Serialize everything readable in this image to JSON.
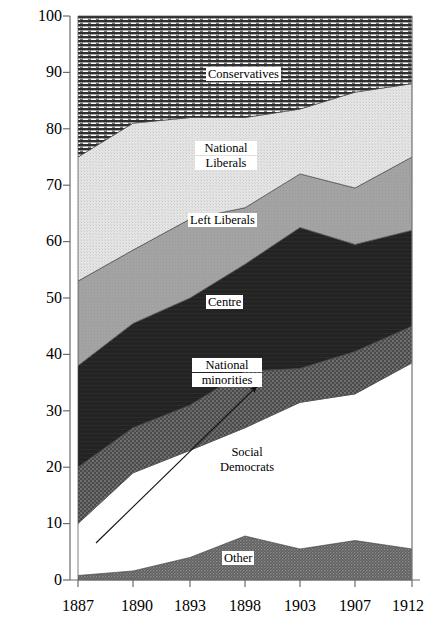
{
  "chart_data": {
    "type": "area",
    "title": "",
    "xlabel": "",
    "ylabel": "Percentage of total votes cast (first ballot)",
    "x": [
      1887,
      1890,
      1893,
      1898,
      1903,
      1907,
      1912
    ],
    "xtick_labels": [
      "1887",
      "1890",
      "1893",
      "1898",
      "1903",
      "1907",
      "1912"
    ],
    "ytick_labels": [
      "0",
      "10",
      "20",
      "30",
      "40",
      "50",
      "60",
      "70",
      "80",
      "90",
      "100"
    ],
    "ylim": [
      0,
      100
    ],
    "ytick_step": 10,
    "grid": false,
    "legend": "inline-band-labels",
    "stacked": true,
    "stack_order_bottom_to_top": [
      "Other",
      "Social Democrats",
      "National minorities",
      "Centre",
      "Left Liberals",
      "National Liberals",
      "Conservatives"
    ],
    "series": [
      {
        "name": "Other",
        "fill": "#6b6b6b",
        "pattern": "fine-dots",
        "values": [
          0.8,
          1.6,
          4.0,
          7.8,
          5.5,
          7.0,
          5.5
        ]
      },
      {
        "name": "Social Democrats",
        "fill": "#ffffff",
        "pattern": "solid-white",
        "values": [
          9.2,
          17.4,
          19.0,
          19.2,
          26.0,
          26.0,
          33.0
        ]
      },
      {
        "name": "National minorities",
        "fill": "#555555",
        "pattern": "coarse-dots",
        "values": [
          10.0,
          8.0,
          8.0,
          10.0,
          6.0,
          7.5,
          6.5
        ]
      },
      {
        "name": "Centre",
        "fill": "#262626",
        "pattern": "solid-dark",
        "values": [
          18.0,
          18.5,
          19.0,
          19.0,
          20.0,
          19.0,
          17.0
        ]
      },
      {
        "name": "Left Liberals",
        "fill": "#9c9c9c",
        "pattern": "solid-mid-gray",
        "values": [
          15.0,
          13.0,
          14.0,
          10.0,
          9.5,
          10.0,
          13.0
        ]
      },
      {
        "name": "National Liberals",
        "fill": "#dedede",
        "pattern": "light-stipple",
        "values": [
          22.0,
          22.5,
          18.0,
          16.0,
          16.5,
          17.0,
          13.0
        ]
      },
      {
        "name": "Conservatives",
        "fill": "#3a3a3a",
        "pattern": "horizontal-lines",
        "values": [
          25.0,
          19.0,
          18.0,
          18.0,
          16.5,
          13.5,
          12.0
        ]
      }
    ],
    "cumulative_tops": {
      "Other": [
        0.8,
        1.6,
        4.0,
        7.8,
        5.5,
        7.0,
        5.5
      ],
      "Social Democrats": [
        10.0,
        19.0,
        23.0,
        27.0,
        31.5,
        33.0,
        38.5
      ],
      "National minorities": [
        20.0,
        27.0,
        31.0,
        37.0,
        37.5,
        40.5,
        45.0
      ],
      "Centre": [
        38.0,
        45.5,
        50.0,
        56.0,
        62.5,
        59.5,
        62.0
      ],
      "Left Liberals": [
        53.0,
        58.5,
        64.0,
        66.0,
        72.0,
        69.5,
        75.0
      ],
      "National Liberals": [
        75.0,
        81.0,
        82.0,
        82.0,
        83.5,
        86.5,
        88.0
      ],
      "Conservatives": [
        100,
        100,
        100,
        100,
        100,
        100,
        100
      ]
    },
    "annotations": [
      {
        "name": "social-democrats-arrow",
        "type": "arrow",
        "from": [
          1888.2,
          6.5
        ],
        "to": [
          1899.0,
          34.0
        ]
      }
    ]
  },
  "labels": {
    "conservatives": "Conservatives",
    "national_liberals_line1": "National",
    "national_liberals_line2": "Liberals",
    "left_liberals": "Left Liberals",
    "centre": "Centre",
    "national_minorities_line1": "National",
    "national_minorities_line2": "minorities",
    "social_democrats_line1": "Social",
    "social_democrats_line2": "Democrats",
    "other": "Other"
  },
  "axis": {
    "y_title": "Percentage of total votes cast (first ballot)",
    "y_ticks": [
      "100",
      "90",
      "80",
      "70",
      "60",
      "50",
      "40",
      "30",
      "20",
      "10",
      "0"
    ],
    "x_ticks": [
      "1887",
      "1890",
      "1893",
      "1898",
      "1903",
      "1907",
      "1912"
    ]
  },
  "colors": {
    "conservatives": "#3a3a3a",
    "national_liberals": "#dedede",
    "left_liberals": "#9c9c9c",
    "centre": "#262626",
    "national_minorities": "#555555",
    "social_democrats": "#ffffff",
    "other": "#6b6b6b",
    "axis": "#555555",
    "text": "#000000"
  }
}
